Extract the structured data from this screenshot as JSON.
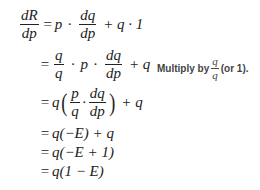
{
  "derivation": {
    "lhs": {
      "numerator": "dR",
      "denominator": "dp"
    },
    "line1": {
      "p": "p",
      "frac_num": "dq",
      "frac_den": "dp",
      "rest": "+ q · 1"
    },
    "line2": {
      "frac1_num": "q",
      "frac1_den": "q",
      "p": "p",
      "frac2_num": "dq",
      "frac2_den": "dp",
      "rest": "+ q"
    },
    "line3": {
      "q": "q",
      "frac1_num": "p",
      "frac1_den": "q",
      "frac2_num": "dq",
      "frac2_den": "dp",
      "rest": "+ q"
    },
    "line4": "q(−E) + q",
    "line5": "q(−E + 1)",
    "line6": "q(1 − E)",
    "equals": "="
  },
  "annotation": {
    "prefix": "Multiply by",
    "frac_num": "q",
    "frac_den": "q",
    "suffix": "(or 1)."
  }
}
